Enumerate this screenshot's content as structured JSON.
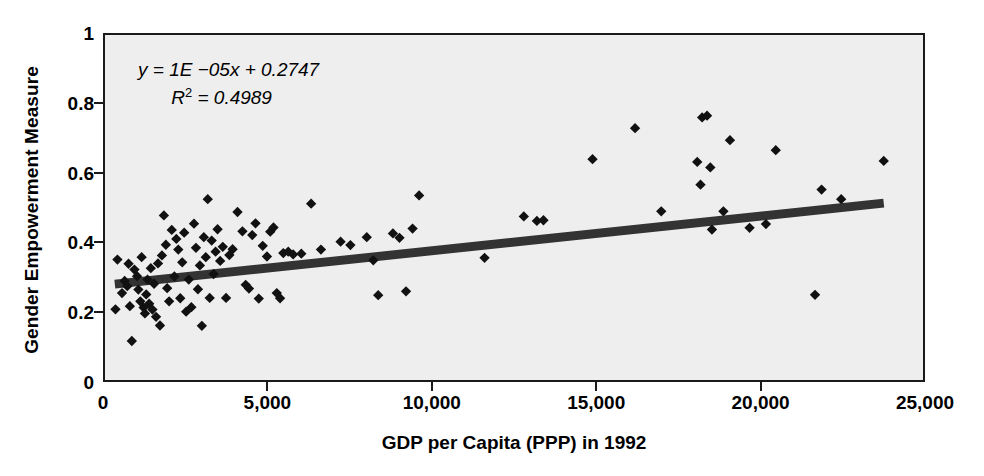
{
  "chart_data": {
    "type": "scatter",
    "title": "",
    "xlabel": "GDP per Capita (PPP) in 1992",
    "ylabel": "Gender Empowerment Measure",
    "xlim": [
      0,
      25000
    ],
    "ylim": [
      0,
      1
    ],
    "grid": false,
    "legend": null,
    "background_color": "#eeeeee",
    "marker": "diamond",
    "marker_color": "#111111",
    "xticks": [
      0,
      5000,
      10000,
      15000,
      20000,
      25000
    ],
    "xtick_labels": [
      "0",
      "5,000",
      "10,000",
      "15,000",
      "20,000",
      "25,000"
    ],
    "yticks": [
      0,
      0.2,
      0.4,
      0.6,
      0.8,
      1
    ],
    "ytick_labels": [
      "0",
      "0.2",
      "0.4",
      "0.6",
      "0.8",
      "1"
    ],
    "annotations": {
      "equation": "y = 1E −05x + 0.2747",
      "equation_parts": {
        "y": "y",
        "equals": " = ",
        "slope": "1E −05",
        "x": "x",
        "plus": " + ",
        "intercept": "0.2747"
      },
      "r_squared_label": "R",
      "r_squared_exponent": "2",
      "r_squared_value": " = 0.4989",
      "r_squared_full": "R² = 0.4989"
    },
    "trendline": {
      "type": "linear",
      "slope": 1e-05,
      "intercept": 0.2747,
      "x_start": 300,
      "x_end": 23800,
      "y_start": 0.2777,
      "y_end": 0.5127,
      "color": "#333333",
      "width_px": 9
    },
    "series": [
      {
        "name": "Countries",
        "points": [
          [
            320,
            0.205
          ],
          [
            380,
            0.349
          ],
          [
            520,
            0.252
          ],
          [
            600,
            0.287
          ],
          [
            680,
            0.272
          ],
          [
            720,
            0.337
          ],
          [
            760,
            0.214
          ],
          [
            820,
            0.113
          ],
          [
            900,
            0.32
          ],
          [
            980,
            0.301
          ],
          [
            1020,
            0.262
          ],
          [
            1080,
            0.228
          ],
          [
            1120,
            0.356
          ],
          [
            1180,
            0.21
          ],
          [
            1220,
            0.193
          ],
          [
            1260,
            0.248
          ],
          [
            1300,
            0.291
          ],
          [
            1350,
            0.221
          ],
          [
            1400,
            0.324
          ],
          [
            1450,
            0.204
          ],
          [
            1500,
            0.279
          ],
          [
            1560,
            0.183
          ],
          [
            1620,
            0.338
          ],
          [
            1680,
            0.158
          ],
          [
            1740,
            0.361
          ],
          [
            1800,
            0.477
          ],
          [
            1860,
            0.392
          ],
          [
            1900,
            0.266
          ],
          [
            1960,
            0.228
          ],
          [
            2040,
            0.435
          ],
          [
            2120,
            0.3
          ],
          [
            2180,
            0.409
          ],
          [
            2240,
            0.378
          ],
          [
            2300,
            0.237
          ],
          [
            2360,
            0.341
          ],
          [
            2420,
            0.427
          ],
          [
            2480,
            0.198
          ],
          [
            2560,
            0.291
          ],
          [
            2640,
            0.211
          ],
          [
            2720,
            0.453
          ],
          [
            2780,
            0.383
          ],
          [
            2840,
            0.263
          ],
          [
            2900,
            0.332
          ],
          [
            2960,
            0.157
          ],
          [
            3020,
            0.414
          ],
          [
            3080,
            0.356
          ],
          [
            3140,
            0.524
          ],
          [
            3200,
            0.238
          ],
          [
            3260,
            0.404
          ],
          [
            3320,
            0.307
          ],
          [
            3380,
            0.372
          ],
          [
            3440,
            0.437
          ],
          [
            3520,
            0.345
          ],
          [
            3600,
            0.386
          ],
          [
            3700,
            0.238
          ],
          [
            3800,
            0.362
          ],
          [
            3900,
            0.379
          ],
          [
            4050,
            0.487
          ],
          [
            4200,
            0.431
          ],
          [
            4300,
            0.276
          ],
          [
            4400,
            0.265
          ],
          [
            4500,
            0.42
          ],
          [
            4600,
            0.454
          ],
          [
            4700,
            0.236
          ],
          [
            4820,
            0.389
          ],
          [
            4950,
            0.358
          ],
          [
            5050,
            0.43
          ],
          [
            5150,
            0.442
          ],
          [
            5250,
            0.252
          ],
          [
            5350,
            0.237
          ],
          [
            5450,
            0.368
          ],
          [
            5600,
            0.372
          ],
          [
            5750,
            0.364
          ],
          [
            6000,
            0.366
          ],
          [
            6300,
            0.511
          ],
          [
            6600,
            0.378
          ],
          [
            7200,
            0.401
          ],
          [
            7500,
            0.391
          ],
          [
            8000,
            0.414
          ],
          [
            8200,
            0.347
          ],
          [
            8350,
            0.246
          ],
          [
            8800,
            0.425
          ],
          [
            9000,
            0.412
          ],
          [
            9200,
            0.257
          ],
          [
            9400,
            0.439
          ],
          [
            9600,
            0.535
          ],
          [
            11600,
            0.354
          ],
          [
            12800,
            0.474
          ],
          [
            13200,
            0.461
          ],
          [
            13400,
            0.463
          ],
          [
            14900,
            0.64
          ],
          [
            16200,
            0.73
          ],
          [
            17000,
            0.489
          ],
          [
            18100,
            0.632
          ],
          [
            18200,
            0.566
          ],
          [
            18250,
            0.761
          ],
          [
            18400,
            0.766
          ],
          [
            18500,
            0.616
          ],
          [
            18550,
            0.436
          ],
          [
            18900,
            0.489
          ],
          [
            19100,
            0.695
          ],
          [
            19700,
            0.441
          ],
          [
            20200,
            0.452
          ],
          [
            20500,
            0.666
          ],
          [
            21700,
            0.247
          ],
          [
            21900,
            0.552
          ],
          [
            22500,
            0.524
          ],
          [
            23800,
            0.635
          ]
        ]
      }
    ]
  },
  "axes": {
    "y_title": "Gender Empowerment Measure",
    "x_title": "GDP per Capita (PPP) in 1992"
  }
}
